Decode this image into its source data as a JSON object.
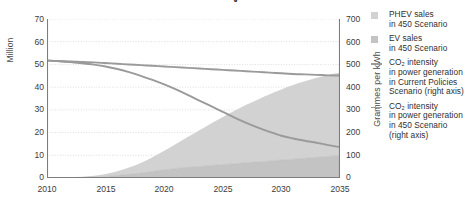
{
  "chart_data": {
    "type": "area",
    "title_visible_fragment": "y",
    "xlabel": "",
    "x": [
      2010,
      2011,
      2012,
      2013,
      2014,
      2015,
      2016,
      2017,
      2018,
      2019,
      2020,
      2021,
      2022,
      2023,
      2024,
      2025,
      2026,
      2027,
      2028,
      2029,
      2030,
      2031,
      2032,
      2033,
      2034,
      2035
    ],
    "xlim": [
      2010,
      2035
    ],
    "xticks": [
      2010,
      2015,
      2020,
      2025,
      2030,
      2035
    ],
    "xticklabels": [
      "2010",
      "2015",
      "2020",
      "2025",
      "2030",
      "2035"
    ],
    "grid": true,
    "legend_position": "right",
    "left_axis": {
      "label": "Million",
      "ylim": [
        0,
        70
      ],
      "yticks": [
        0,
        10,
        20,
        30,
        40,
        50,
        60,
        70
      ],
      "yticklabels": [
        "0",
        "10",
        "20",
        "30",
        "40",
        "50",
        "60",
        "70"
      ]
    },
    "right_axis": {
      "label": "Grammes per kWh",
      "ylim": [
        0,
        700
      ],
      "yticks": [
        0,
        100,
        200,
        300,
        400,
        500,
        600,
        700
      ],
      "yticklabels": [
        "0",
        "100",
        "200",
        "300",
        "400",
        "500",
        "600",
        "700"
      ]
    },
    "stacked_areas": [
      {
        "name": "EV sales in 450 Scenario",
        "axis": "left",
        "color": "#c3c3c3",
        "stack_order": 1,
        "values": [
          0.03,
          0.06,
          0.12,
          0.22,
          0.4,
          0.7,
          1.1,
          1.6,
          2.2,
          2.9,
          3.6,
          4.2,
          4.7,
          5.1,
          5.5,
          5.9,
          6.3,
          6.7,
          7.1,
          7.5,
          7.9,
          8.3,
          8.7,
          9.1,
          9.5,
          9.9
        ]
      },
      {
        "name": "PHEV sales in 450 Scenario",
        "axis": "left",
        "color": "#d2d2d2",
        "stack_order": 2,
        "values": [
          0.03,
          0.07,
          0.15,
          0.3,
          0.6,
          1.1,
          1.9,
          3.0,
          4.4,
          6.2,
          8.4,
          10.8,
          13.3,
          15.9,
          18.5,
          21.0,
          23.3,
          25.5,
          27.5,
          29.4,
          31.1,
          32.6,
          33.9,
          35.0,
          35.9,
          36.5
        ]
      }
    ],
    "lines": [
      {
        "name": "CO2 intensity in power generation in Current Policies Scenario (right axis)",
        "axis": "right",
        "color": "#9a9a9a",
        "values": [
          517,
          515,
          513,
          511,
          509,
          506,
          503,
          500,
          497,
          494,
          491,
          488,
          485,
          482,
          479,
          476,
          473,
          470,
          467,
          464,
          461,
          458,
          456,
          454,
          452,
          451
        ]
      },
      {
        "name": "CO2 intensity in power generation in 450 Scenario (right axis)",
        "axis": "right",
        "color": "#9a9a9a",
        "values": [
          517,
          514,
          510,
          505,
          499,
          491,
          480,
          466,
          450,
          432,
          412,
          390,
          366,
          341,
          316,
          291,
          266,
          243,
          222,
          203,
          186,
          174,
          164,
          155,
          145,
          136
        ]
      }
    ]
  },
  "axes": {
    "left_title": "Million",
    "right_title": "Grammes per kWh"
  },
  "legend": {
    "items": [
      {
        "marker": "swatch",
        "color": "#d2d2d2",
        "line1": "PHEV sales",
        "line2": "in 450 Scenario",
        "line3": "",
        "line4": ""
      },
      {
        "marker": "swatch",
        "color": "#c3c3c3",
        "line1": "EV sales",
        "line2": "in 450 Scenario",
        "line3": "",
        "line4": ""
      },
      {
        "marker": "line",
        "color": "#9a9a9a",
        "line1": "CO₂ intensity",
        "line2": "in power generation",
        "line3": "in Current Policies",
        "line4": "Scenario (right axis)"
      },
      {
        "marker": "line",
        "color": "#9a9a9a",
        "line1": "CO₂ intensity",
        "line2": "in power generation",
        "line3": "in 450 Scenario",
        "line4": "(right axis)"
      }
    ]
  },
  "colors": {
    "axis": "#7d7d7d",
    "grid": "#cfcfcf",
    "text": "#333333",
    "area_phev": "#d2d2d2",
    "area_ev": "#c3c3c3",
    "line": "#9a9a9a"
  }
}
